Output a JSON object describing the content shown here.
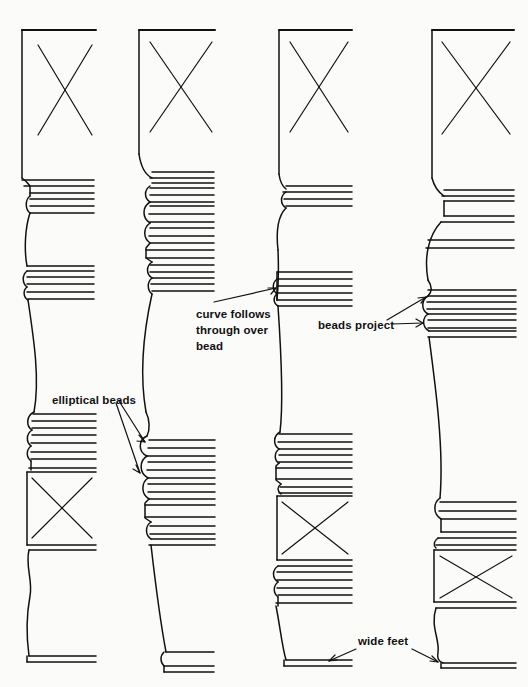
{
  "drawing": {
    "title": "Comparative turned leg / baluster profiles",
    "type": "line-drawing",
    "background_color": "#fbfbf9",
    "line_color": "#111111",
    "canvas": {
      "width": 528,
      "height": 687
    }
  },
  "annotations": [
    {
      "id": "curve-follows-through-over-bead",
      "text": "curve follows\nthrough over\nbead",
      "label_x": 196,
      "label_y": 306,
      "arrows": [
        {
          "from_x": 214,
          "from_y": 302,
          "to_x": 279,
          "to_y": 287
        }
      ],
      "target_column": 3
    },
    {
      "id": "beads-project",
      "text": "beads project",
      "label_x": 318,
      "label_y": 317,
      "arrows": [
        {
          "from_x": 387,
          "from_y": 319,
          "to_x": 428,
          "to_y": 297
        },
        {
          "from_x": 390,
          "from_y": 324,
          "to_x": 424,
          "to_y": 323
        }
      ],
      "target_column": 4
    },
    {
      "id": "elliptical-beads",
      "text": "elliptical beads",
      "label_x": 52,
      "label_y": 392,
      "arrows": [
        {
          "from_x": 118,
          "from_y": 400,
          "to_x": 147,
          "to_y": 443
        },
        {
          "from_x": 116,
          "from_y": 402,
          "to_x": 141,
          "to_y": 473
        }
      ],
      "target_column": 2
    },
    {
      "id": "wide-feet",
      "text": "wide feet",
      "label_x": 358,
      "label_y": 633,
      "arrows": [
        {
          "from_x": 356,
          "from_y": 648,
          "to_x": 330,
          "to_y": 661
        },
        {
          "from_x": 410,
          "from_y": 648,
          "to_x": 437,
          "to_y": 662
        }
      ],
      "target_column": "3 and 4"
    }
  ],
  "columns": [
    {
      "index": 1,
      "name": "leg-profile-1",
      "description": "slender turned leg, square post at top with X, slim beads, long taper, square block low with X, flared foot",
      "left_edge_x": 20,
      "right_edge_x": 95,
      "top_block": {
        "y_top": 28,
        "y_bottom": 178,
        "has_x_mark": true
      },
      "lower_block": {
        "y_top": 470,
        "y_bottom": 545,
        "has_x_mark": true
      },
      "foot": {
        "y": 668,
        "width": "narrow"
      }
    },
    {
      "index": 2,
      "name": "leg-profile-2",
      "description": "square post with X, deep stack of round beads below, elliptical beads low, slim tapering shaft, narrow foot",
      "left_edge_x": 137,
      "right_edge_x": 212,
      "top_block": {
        "y_top": 28,
        "y_bottom": 160,
        "has_x_mark": true
      },
      "lower_block": null,
      "foot": {
        "y": 668,
        "width": "narrow"
      }
    },
    {
      "index": 3,
      "name": "leg-profile-3",
      "description": "square post with X, curve follows through over bead, flat ring beads, lower square block with X, wide foot",
      "left_edge_x": 277,
      "right_edge_x": 352,
      "top_block": {
        "y_top": 28,
        "y_bottom": 175,
        "has_x_mark": true
      },
      "lower_block": {
        "y_top": 488,
        "y_bottom": 560,
        "has_x_mark": true
      },
      "foot": {
        "y": 665,
        "width": "wide"
      }
    },
    {
      "index": 4,
      "name": "leg-profile-4",
      "description": "heaviest profile, square post with X, strongly projecting beads, swelling ogee shaft, lower square block with X, wide foot",
      "left_edge_x": 430,
      "right_edge_x": 513,
      "top_block": {
        "y_top": 28,
        "y_bottom": 180,
        "has_x_mark": true
      },
      "lower_block": {
        "y_top": 530,
        "y_bottom": 600,
        "has_x_mark": true
      },
      "foot": {
        "y": 663,
        "width": "wide"
      }
    }
  ]
}
